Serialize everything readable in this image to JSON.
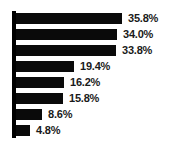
{
  "chart_data": {
    "type": "bar",
    "orientation": "horizontal",
    "title": "",
    "subtitle": "",
    "xlabel": "",
    "ylabel": "",
    "categories": [
      "",
      "",
      "",
      "",
      "",
      "",
      "",
      ""
    ],
    "values": [
      35.8,
      34.0,
      33.8,
      19.4,
      16.2,
      15.8,
      8.6,
      4.8
    ],
    "data_labels": [
      "35.8%",
      "34.0%",
      "33.8%",
      "19.4%",
      "16.2%",
      "15.8%",
      "8.6%",
      "4.8%"
    ],
    "xlim": [
      0,
      40
    ],
    "grid": false,
    "legend": false,
    "legend_position": "none",
    "series": [
      {
        "name": "",
        "values": [
          35.8,
          34.0,
          33.8,
          19.4,
          16.2,
          15.8,
          8.6,
          4.8
        ]
      }
    ],
    "colors": {
      "bar": "#0a0a0a",
      "axis": "#000000",
      "label_text": "#1a1a1a",
      "background": "#ffffff"
    }
  },
  "bars": [
    {
      "label": "35.8%",
      "value": 35.8,
      "width_px": 106
    },
    {
      "label": "34.0%",
      "value": 34.0,
      "width_px": 101
    },
    {
      "label": "33.8%",
      "value": 33.8,
      "width_px": 100
    },
    {
      "label": "19.4%",
      "value": 19.4,
      "width_px": 58
    },
    {
      "label": "16.2%",
      "value": 16.2,
      "width_px": 48
    },
    {
      "label": "15.8%",
      "value": 15.8,
      "width_px": 47
    },
    {
      "label": "8.6%",
      "value": 8.6,
      "width_px": 26
    },
    {
      "label": "4.8%",
      "value": 4.8,
      "width_px": 14
    }
  ]
}
